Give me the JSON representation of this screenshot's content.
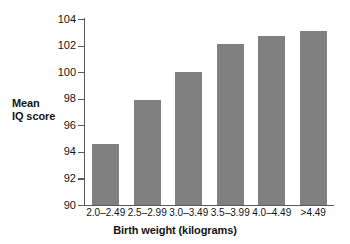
{
  "chart_data": {
    "type": "bar",
    "title": "",
    "xlabel": "Birth weight (kilograms)",
    "ylabel": "Mean IQ score",
    "categories": [
      "2.0–2.49",
      "2.5–2.99",
      "3.0–3.49",
      "3.5–3.99",
      "4.0–4.49",
      ">4.49"
    ],
    "values": [
      94.6,
      97.9,
      100.0,
      102.1,
      102.7,
      103.1
    ],
    "ylim": [
      90,
      104
    ],
    "ytick_labels": [
      "90",
      "92",
      "94",
      "96",
      "98",
      "100",
      "102",
      "104"
    ],
    "ytick_values": [
      90,
      92,
      94,
      96,
      98,
      100,
      102,
      104
    ],
    "grid": false,
    "legend": "none",
    "bar_color": "#808080",
    "axis_color": "#5a5a5a",
    "background": "#ffffff"
  },
  "axes": {
    "y_title_line1": "Mean",
    "y_title_line2": "IQ score",
    "x_title": "Birth weight (kilograms)"
  }
}
